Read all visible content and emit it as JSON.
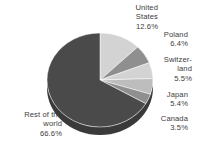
{
  "chart_data": {
    "type": "pie",
    "title": "",
    "subtitle": "",
    "xlabel": "",
    "ylabel": "",
    "legend_position": "none",
    "grid": false,
    "labels_show_percent": true,
    "start_angle_deg": 0,
    "direction": "clockwise",
    "categories": [
      "United States",
      "Poland",
      "Switzerland",
      "Japan",
      "Canada",
      "Rest of the world"
    ],
    "values": [
      12.6,
      6.4,
      5.5,
      5.4,
      3.5,
      66.6
    ],
    "value_labels": [
      "12.6%",
      "6.4%",
      "5.5%",
      "5.4%",
      "3.5%",
      "66.6%"
    ],
    "colors": [
      "#d3d3d3",
      "#8f8f8f",
      "#d3d3d3",
      "#bdbdbd",
      "#8f8f8f",
      "#4a4a4a"
    ],
    "slices": [
      {
        "name": "United States",
        "value": 12.6,
        "value_label": "12.6%",
        "color": "#d3d3d3",
        "start_deg": 0.0,
        "end_deg": 45.36
      },
      {
        "name": "Poland",
        "value": 6.4,
        "value_label": "6.4%",
        "color": "#8f8f8f",
        "start_deg": 45.36,
        "end_deg": 68.4
      },
      {
        "name": "Switzerland",
        "value": 5.5,
        "value_label": "5.5%",
        "color": "#d3d3d3",
        "start_deg": 68.4,
        "end_deg": 88.2
      },
      {
        "name": "Japan",
        "value": 5.4,
        "value_label": "5.4%",
        "color": "#bdbdbd",
        "start_deg": 88.2,
        "end_deg": 107.64
      },
      {
        "name": "Canada",
        "value": 3.5,
        "value_label": "3.5%",
        "color": "#8f8f8f",
        "start_deg": 107.64,
        "end_deg": 120.24
      },
      {
        "name": "Rest of the world",
        "value": 66.6,
        "value_label": "66.6%",
        "color": "#4a4a4a",
        "start_deg": 120.24,
        "end_deg": 360.0
      }
    ]
  },
  "labels": {
    "united_states": {
      "line1": "United",
      "line2": "States",
      "value": "12.6%"
    },
    "poland": {
      "line1": "Poland",
      "line2": "",
      "value": "6.4%"
    },
    "switzerland": {
      "line1": "Switzer-",
      "line2": "land",
      "value": "5.5%"
    },
    "japan": {
      "line1": "Japan",
      "line2": "",
      "value": "5.4%"
    },
    "canada": {
      "line1": "Canada",
      "line2": "",
      "value": "3.5%"
    },
    "rest_of_world": {
      "line1": "Rest of the",
      "line2": "world",
      "value": "66.6%"
    }
  },
  "style": {
    "background": "#ffffff",
    "text_color": "#3d3d3d",
    "slice_light": "#d3d3d3",
    "slice_medium": "#8f8f8f",
    "slice_medium_light": "#bdbdbd",
    "slice_dark": "#4a4a4a",
    "slice_dark_side": "#3a3a3a"
  }
}
